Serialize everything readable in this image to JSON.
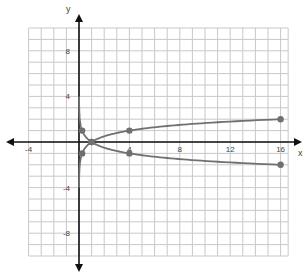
{
  "chart_data": {
    "type": "line",
    "title": "",
    "xlabel": "x",
    "ylabel": "y",
    "xlim": [
      -4,
      16.5
    ],
    "ylim": [
      -10,
      10
    ],
    "grid": true,
    "x_ticks": [
      -4,
      4,
      8,
      12,
      16
    ],
    "y_ticks": [
      8,
      4,
      -4,
      -8
    ],
    "x_tick_labels": [
      "-4",
      "4",
      "8",
      "12",
      "16"
    ],
    "y_tick_labels": [
      "8",
      "4",
      "-4",
      "-8"
    ],
    "series": [
      {
        "name": "y = log_4(x)",
        "color": "#707070",
        "x": [
          0.01,
          0.0625,
          0.25,
          1,
          4,
          16
        ],
        "y": [
          -3.32,
          -2,
          -1,
          0,
          1,
          2
        ],
        "marked_points": [
          [
            0.25,
            -1
          ],
          [
            1,
            0
          ],
          [
            4,
            1
          ],
          [
            16,
            2
          ]
        ]
      },
      {
        "name": "y = -log_4(x)",
        "color": "#707070",
        "x": [
          0.01,
          0.0625,
          0.25,
          1,
          4,
          16
        ],
        "y": [
          3.32,
          2,
          1,
          0,
          -1,
          -2
        ],
        "marked_points": [
          [
            0.25,
            1
          ],
          [
            1,
            0
          ],
          [
            4,
            -1
          ],
          [
            16,
            -2
          ]
        ]
      }
    ]
  },
  "axes": {
    "x_label": "x",
    "y_label": "y"
  }
}
